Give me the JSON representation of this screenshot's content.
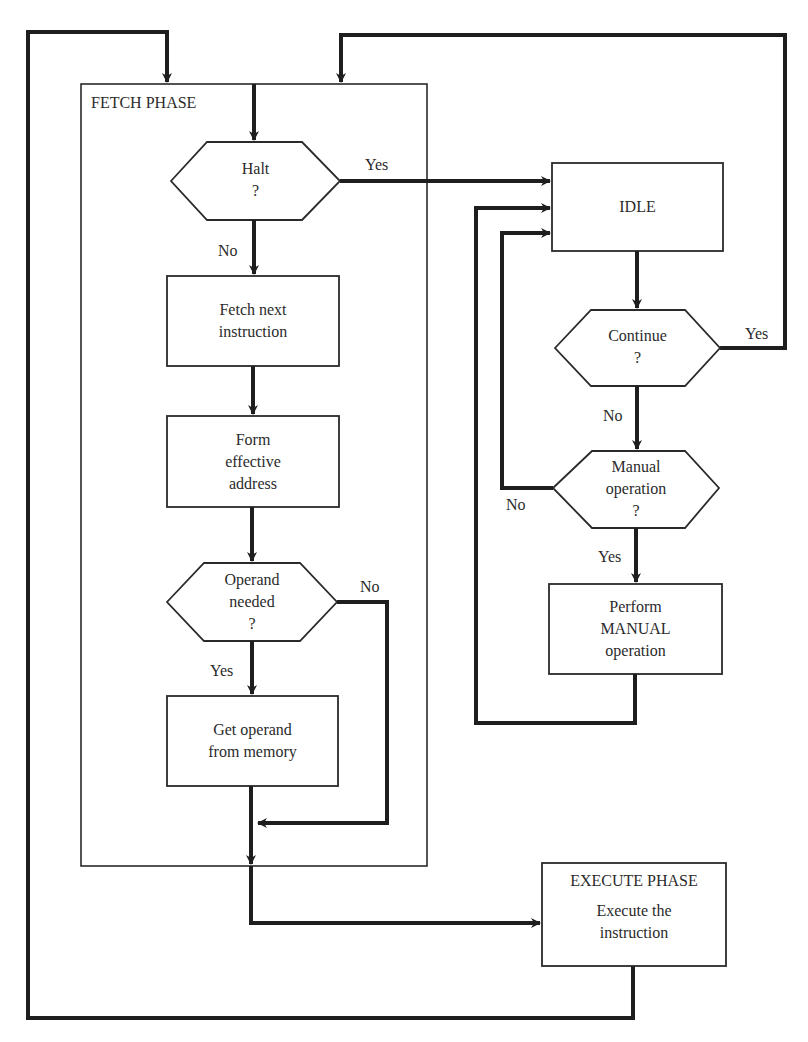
{
  "diagram": {
    "fetch_phase": {
      "title": "FETCH PHASE"
    },
    "execute_phase": {
      "title": "EXECUTE PHASE",
      "lines": [
        "Execute the",
        "instruction"
      ]
    },
    "nodes": {
      "halt": {
        "lines": [
          "Halt",
          "?"
        ]
      },
      "fetch_next": {
        "lines": [
          "Fetch next",
          "instruction"
        ]
      },
      "form_address": {
        "lines": [
          "Form",
          "effective",
          "address"
        ]
      },
      "operand_needed": {
        "lines": [
          "Operand",
          "needed",
          "?"
        ]
      },
      "get_operand": {
        "lines": [
          "Get operand",
          "from memory"
        ]
      },
      "idle": {
        "lines": [
          "IDLE"
        ]
      },
      "continue": {
        "lines": [
          "Continue",
          "?"
        ]
      },
      "manual": {
        "lines": [
          "Manual",
          "operation",
          "?"
        ]
      },
      "perform_manual": {
        "lines": [
          "Perform",
          "MANUAL",
          "operation"
        ]
      }
    },
    "edge_labels": {
      "halt_yes": "Yes",
      "halt_no": "No",
      "operand_no": "No",
      "operand_yes": "Yes",
      "continue_yes": "Yes",
      "continue_no": "No",
      "manual_no": "No",
      "manual_yes": "Yes"
    },
    "colors": {
      "ink": "#1e1e1e",
      "background": "#ffffff"
    }
  }
}
